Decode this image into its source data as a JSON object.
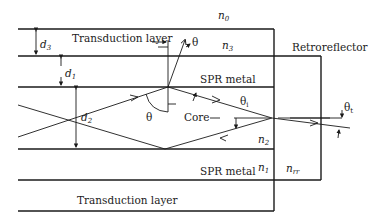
{
  "figure": {
    "type": "schematic",
    "colors": {
      "line": "#1a1a1a",
      "background": "#ffffff"
    }
  },
  "labels": {
    "transduction_top": "Transduction layer",
    "transduction_bottom": "Transduction layer",
    "spr_top": "SPR metal",
    "spr_bottom": "SPR metal",
    "core": "Core",
    "retroreflector": "Retroreflector"
  },
  "indices": {
    "n0": "n",
    "n0_sub": "0",
    "n3": "n",
    "n3_sub": "3",
    "n2": "n",
    "n2_sub": "2",
    "n1": "n",
    "n1_sub": "1",
    "nrr": "n",
    "nrr_sub": "rr"
  },
  "dimensions": {
    "d3": "d",
    "d3_sub": "3",
    "d1": "d",
    "d1_sub": "1",
    "d2": "d",
    "d2_sub": "2"
  },
  "angles": {
    "theta_core": "θ",
    "theta_top": "θ",
    "theta_i": "θ",
    "theta_i_sub": "i",
    "theta_t": "θ",
    "theta_t_sub": "t"
  }
}
